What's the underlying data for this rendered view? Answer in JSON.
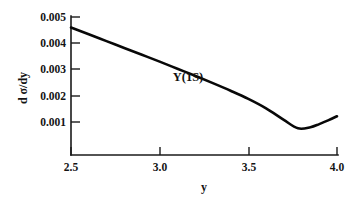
{
  "chart_data": {
    "type": "line",
    "title": "",
    "subtitle": "",
    "xlabel": "y",
    "ylabel": "d σ/dy",
    "xlim": [
      2.5,
      4.0
    ],
    "ylim": [
      0.0,
      0.005
    ],
    "grid": false,
    "legend_position": "none",
    "x_ticks": [
      2.5,
      3.0,
      3.5,
      4.0
    ],
    "x_tick_labels": [
      "2.5",
      "3.0",
      "3.5",
      "4.0"
    ],
    "y_ticks": [
      0.001,
      0.002,
      0.003,
      0.004,
      0.005
    ],
    "y_tick_labels": [
      "0.001",
      "0.002",
      "0.003",
      "0.004",
      "0.005"
    ],
    "annotations": [
      {
        "text": "Y(1S)",
        "x": 3.16,
        "y": 0.00255
      }
    ],
    "series": [
      {
        "name": "Y(1S)",
        "color": "#080808",
        "x": [
          2.5,
          2.6,
          2.7,
          2.8,
          2.9,
          3.0,
          3.1,
          3.2,
          3.3,
          3.4,
          3.5,
          3.6,
          3.7,
          3.78,
          3.85,
          3.9,
          3.95,
          4.0
        ],
        "y": [
          0.0046,
          0.00434,
          0.00408,
          0.00382,
          0.00356,
          0.0033,
          0.00303,
          0.00276,
          0.00248,
          0.00219,
          0.00188,
          0.00152,
          0.00108,
          0.00076,
          0.0008,
          0.00092,
          0.00106,
          0.00122
        ]
      }
    ]
  },
  "axis_titles": {
    "x": "y",
    "y": "d σ/dy"
  }
}
